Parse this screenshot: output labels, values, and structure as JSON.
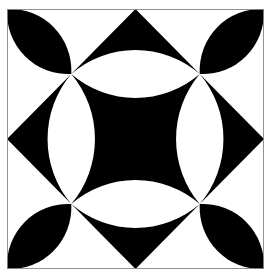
{
  "figure": {
    "title": "Geometric tile pattern: concave-square center with lens petals and diamond points",
    "colors": {
      "background": "#ffffff",
      "ink": "#000000",
      "border": "#888888"
    },
    "grid_units": 4,
    "crossing_points": [
      [
        1,
        1
      ],
      [
        3,
        1
      ],
      [
        1,
        3
      ],
      [
        3,
        3
      ]
    ],
    "edge_apexes": [
      [
        2,
        0
      ],
      [
        4,
        2
      ],
      [
        2,
        4
      ],
      [
        0,
        2
      ]
    ],
    "lens_arc_radius": 1.54,
    "leaf_arc_radius": 0.95
  }
}
